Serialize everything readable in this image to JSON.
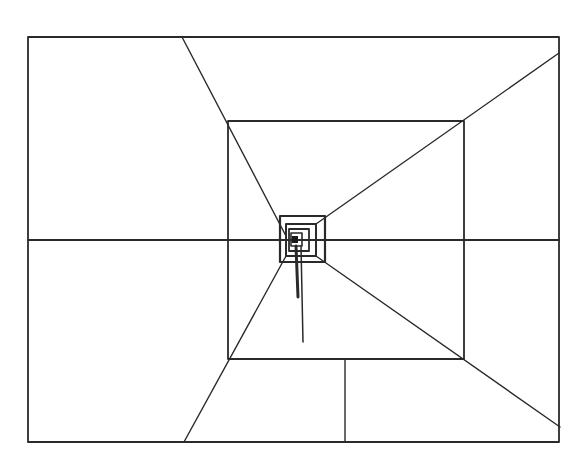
{
  "diagram": {
    "type": "perspective-tunnel-line-drawing",
    "stroke_color": "#2a2a2a",
    "background": "#ffffff",
    "outer_rect": {
      "x1": 28,
      "y1": 37,
      "x2": 559,
      "y2": 442
    },
    "inner_rect": {
      "x1": 228,
      "y1": 121,
      "x2": 464,
      "y2": 359
    },
    "nested_rects": [
      {
        "x1": 280,
        "y1": 216,
        "x2": 325,
        "y2": 262
      },
      {
        "x1": 286,
        "y1": 224,
        "x2": 316,
        "y2": 256
      },
      {
        "x1": 289,
        "y1": 229,
        "x2": 309,
        "y2": 251
      },
      {
        "x1": 291,
        "y1": 233,
        "x2": 302,
        "y2": 246
      }
    ],
    "core_square": {
      "x1": 292,
      "y1": 236,
      "x2": 298,
      "y2": 243
    },
    "horizon_line": {
      "y": 240,
      "x1": 28,
      "x2": 559
    },
    "radials": [
      {
        "name": "top-left",
        "x1": 182,
        "y1": 37,
        "x2": 286,
        "y2": 236
      },
      {
        "name": "top-right",
        "x1": 559,
        "y1": 53,
        "x2": 316,
        "y2": 224
      },
      {
        "name": "bottom-right",
        "x1": 560,
        "y1": 427,
        "x2": 316,
        "y2": 256
      },
      {
        "name": "bottom-left",
        "x1": 184,
        "y1": 442,
        "x2": 286,
        "y2": 256
      }
    ],
    "floor_divider": {
      "x": 345,
      "y1": 359,
      "y2": 442
    },
    "stems": [
      {
        "x1": 296,
        "y1": 246,
        "x2": 298,
        "y2": 297
      },
      {
        "x1": 301,
        "y1": 246,
        "x2": 303,
        "y2": 342
      }
    ]
  }
}
